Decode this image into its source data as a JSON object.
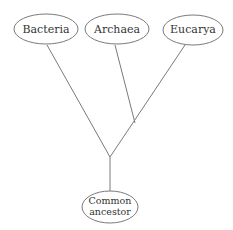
{
  "diagram": {
    "type": "phylogenetic-tree",
    "colors": {
      "stroke": "#7a7a7a",
      "text": "#333333",
      "background": "#ffffff"
    },
    "nodes": {
      "bacteria": {
        "label": "Bacteria"
      },
      "archaea": {
        "label": "Archaea"
      },
      "eucarya": {
        "label": "Eucarya"
      },
      "root": {
        "line1": "Common",
        "line2": "ancestor"
      }
    },
    "edges": [
      {
        "from": "root",
        "to": "bacteria"
      },
      {
        "from": "root",
        "to": "eucarya"
      },
      {
        "from": "archaea-eucarya-branch",
        "to": "archaea"
      }
    ]
  }
}
